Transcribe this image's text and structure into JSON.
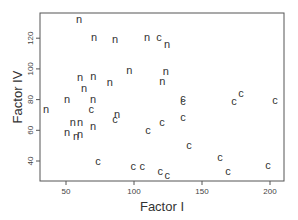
{
  "chart_data": {
    "type": "scatter",
    "title": "",
    "xlabel": "Factor I",
    "ylabel": "Factor IV",
    "xlim": [
      30,
      212
    ],
    "ylim": [
      24,
      141
    ],
    "xticks": [
      50,
      100,
      150,
      200
    ],
    "yticks": [
      40,
      60,
      80,
      100,
      120
    ],
    "grid": false,
    "legend": null,
    "marker_style": "text labels (n / c)",
    "series": [
      {
        "name": "n",
        "points": [
          {
            "x": 59.6,
            "y": 132.4
          },
          {
            "x": 70.6,
            "y": 120.5
          },
          {
            "x": 86.0,
            "y": 119.2
          },
          {
            "x": 109.6,
            "y": 121.1
          },
          {
            "x": 124.3,
            "y": 116.5
          },
          {
            "x": 60.3,
            "y": 94.5
          },
          {
            "x": 70.0,
            "y": 95.1
          },
          {
            "x": 63.2,
            "y": 87.7
          },
          {
            "x": 82.3,
            "y": 91.6
          },
          {
            "x": 96.6,
            "y": 99.4
          },
          {
            "x": 120.8,
            "y": 92.2
          },
          {
            "x": 123.4,
            "y": 98.5
          },
          {
            "x": 50.7,
            "y": 80.4
          },
          {
            "x": 69.9,
            "y": 80.4
          },
          {
            "x": 35.3,
            "y": 73.6
          },
          {
            "x": 87.5,
            "y": 70.5
          },
          {
            "x": 55.1,
            "y": 65.1
          },
          {
            "x": 60.3,
            "y": 65.1
          },
          {
            "x": 69.9,
            "y": 62.5
          },
          {
            "x": 50.7,
            "y": 58.6
          },
          {
            "x": 57.4,
            "y": 56.6
          },
          {
            "x": 60.3,
            "y": 57.9
          }
        ]
      },
      {
        "name": "c",
        "points": [
          {
            "x": 118.4,
            "y": 121.1
          },
          {
            "x": 68.5,
            "y": 73.6
          },
          {
            "x": 86.0,
            "y": 67.4
          },
          {
            "x": 110.3,
            "y": 59.9
          },
          {
            "x": 120.6,
            "y": 65.1
          },
          {
            "x": 136.0,
            "y": 68.7
          },
          {
            "x": 136.0,
            "y": 78.8
          },
          {
            "x": 136.0,
            "y": 81.3
          },
          {
            "x": 140.4,
            "y": 50.4
          },
          {
            "x": 173.5,
            "y": 78.8
          },
          {
            "x": 178.7,
            "y": 84.6
          },
          {
            "x": 203.7,
            "y": 80.0
          },
          {
            "x": 73.5,
            "y": 39.8
          },
          {
            "x": 99.4,
            "y": 36.8
          },
          {
            "x": 106.0,
            "y": 36.8
          },
          {
            "x": 119.3,
            "y": 33.5
          },
          {
            "x": 124.5,
            "y": 30.9
          },
          {
            "x": 163.2,
            "y": 42.9
          },
          {
            "x": 169.1,
            "y": 33.5
          },
          {
            "x": 198.5,
            "y": 37.3
          }
        ]
      }
    ]
  },
  "layout": {
    "plot_box": {
      "left": 40,
      "top": 13,
      "right": 284,
      "bottom": 181
    },
    "x_map": {
      "v0": 50,
      "px0": 66,
      "px_per_unit": 1.36
    },
    "y_map": {
      "v0": 40,
      "px0": 161,
      "px_per_unit": 1.535
    }
  }
}
